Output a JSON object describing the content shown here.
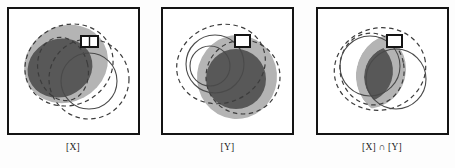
{
  "figure": {
    "type": "set-overlap-diagram",
    "background_color": "#fdfdfd",
    "panel_count": 3,
    "frame_color": "#141414",
    "frame_width_px": 2
  },
  "palette": {
    "dark_gray": "#585858",
    "mid_gray": "#6e6e6e",
    "light_gray": "#b4b4b4",
    "pale_gray": "#c9c9c9",
    "outline_solid": "#4a4a4a",
    "outline_dashed": "#3c3c3c",
    "white": "#ffffff",
    "black": "#141414"
  },
  "panels": [
    {
      "id": "panel-x",
      "label": "[X]",
      "label_plain": "[X]",
      "marker": {
        "name": "region-marker",
        "shape": "rectangle",
        "fill": "#ffffff",
        "stroke": "#141414",
        "divided": true,
        "x": 88,
        "y": 30,
        "width": 16,
        "height": 11
      },
      "shapes": [
        {
          "name": "light-blob",
          "kind": "filled-ellipse",
          "fill": "#b4b4b4",
          "cx": 57,
          "cy": 55,
          "rx": 43,
          "ry": 38,
          "rotate": -28
        },
        {
          "name": "dark-blob",
          "kind": "filled-ellipse",
          "fill": "#585858",
          "cx": 52,
          "cy": 60,
          "rx": 33,
          "ry": 29,
          "rotate": -22
        },
        {
          "name": "dashed-ellipse-outer",
          "kind": "dashed-ellipse",
          "stroke": "#3c3c3c",
          "cx": 62,
          "cy": 58,
          "rx": 45,
          "ry": 40,
          "rotate": -26
        },
        {
          "name": "dashed-ellipse-inner",
          "kind": "dashed-ellipse",
          "stroke": "#3c3c3c",
          "cx": 54,
          "cy": 60,
          "rx": 26,
          "ry": 32,
          "rotate": -12
        },
        {
          "name": "solid-circle",
          "kind": "solid-circle",
          "stroke": "#4a4a4a",
          "cx": 80,
          "cy": 72,
          "r": 28
        },
        {
          "name": "dashed-circle-large",
          "kind": "dashed-circle",
          "stroke": "#3c3c3c",
          "cx": 80,
          "cy": 70,
          "r": 40
        }
      ]
    },
    {
      "id": "panel-y",
      "label": "[Y]",
      "label_plain": "[Y]",
      "marker": {
        "name": "region-marker",
        "shape": "rectangle",
        "fill": "#ffffff",
        "stroke": "#141414",
        "divided": false,
        "x": 74,
        "y": 30,
        "width": 14,
        "height": 11
      },
      "shapes": [
        {
          "name": "light-blob",
          "kind": "filled-ellipse",
          "fill": "#b4b4b4",
          "cx": 74,
          "cy": 68,
          "rx": 40,
          "ry": 42,
          "rotate": 6
        },
        {
          "name": "dark-blob",
          "kind": "filled-ellipse",
          "fill": "#585858",
          "cx": 73,
          "cy": 70,
          "rx": 29,
          "ry": 30,
          "rotate": 0
        },
        {
          "name": "dashed-ellipse-outer",
          "kind": "dashed-ellipse",
          "stroke": "#3c3c3c",
          "cx": 60,
          "cy": 56,
          "rx": 45,
          "ry": 40,
          "rotate": -18
        },
        {
          "name": "dashed-ellipse-inner",
          "kind": "dashed-ellipse",
          "stroke": "#3c3c3c",
          "cx": 82,
          "cy": 70,
          "rx": 36,
          "ry": 36,
          "rotate": 12
        },
        {
          "name": "solid-circle",
          "kind": "solid-circle",
          "stroke": "#4a4a4a",
          "cx": 52,
          "cy": 56,
          "r": 28
        },
        {
          "name": "solid-circle-small",
          "kind": "solid-circle",
          "stroke": "#4a4a4a",
          "cx": 48,
          "cy": 58,
          "r": 20
        }
      ]
    },
    {
      "id": "panel-x-and-y",
      "label": "[X] ∩ [Y]",
      "label_plain": "[X] n [Y]",
      "marker": {
        "name": "region-marker",
        "shape": "rectangle",
        "fill": "#ffffff",
        "stroke": "#141414",
        "divided": false,
        "x": 72,
        "y": 30,
        "width": 14,
        "height": 11
      },
      "shapes": [
        {
          "name": "light-blob",
          "kind": "filled-lens",
          "fill": "#b4b4b4",
          "cx": 62,
          "cy": 64,
          "rx": 38,
          "ry": 38
        },
        {
          "name": "dark-blob",
          "kind": "filled-lens",
          "fill": "#585858",
          "cx": 58,
          "cy": 64,
          "rx": 22,
          "ry": 26
        },
        {
          "name": "dashed-ellipse-outer",
          "kind": "dashed-ellipse",
          "stroke": "#3c3c3c",
          "cx": 64,
          "cy": 62,
          "rx": 46,
          "ry": 42,
          "rotate": -14
        },
        {
          "name": "dashed-ellipse-inner",
          "kind": "dashed-ellipse",
          "stroke": "#3c3c3c",
          "cx": 56,
          "cy": 62,
          "rx": 32,
          "ry": 36,
          "rotate": -8
        },
        {
          "name": "solid-circle",
          "kind": "solid-circle",
          "stroke": "#4a4a4a",
          "cx": 78,
          "cy": 70,
          "r": 30
        },
        {
          "name": "solid-circle-left",
          "kind": "solid-circle",
          "stroke": "#4a4a4a",
          "cx": 52,
          "cy": 58,
          "r": 30
        }
      ]
    }
  ]
}
